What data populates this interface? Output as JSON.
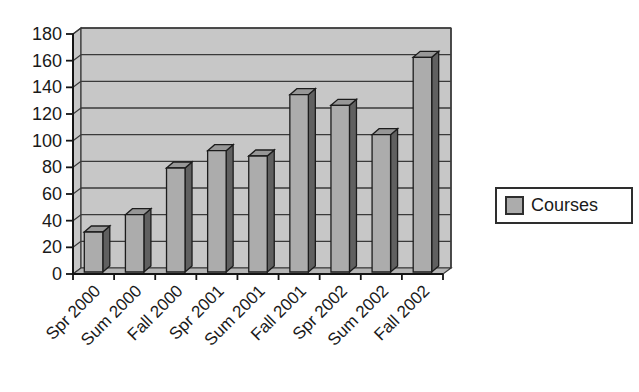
{
  "chart_data": {
    "type": "bar",
    "title": "",
    "xlabel": "",
    "ylabel": "",
    "categories": [
      "Spr 2000",
      "Sum 2000",
      "Fall 2000",
      "Spr 2001",
      "Sum 2001",
      "Fall 2001",
      "Spr 2002",
      "Sum 2002",
      "Fall 2002"
    ],
    "series": [
      {
        "name": "Courses",
        "values": [
          30,
          43,
          78,
          91,
          87,
          133,
          125,
          103,
          161
        ]
      }
    ],
    "ylim": [
      0,
      180
    ],
    "yticks": [
      0,
      20,
      40,
      60,
      80,
      100,
      120,
      140,
      160,
      180
    ],
    "grid": "horizontal",
    "effect": "3d",
    "legend": {
      "label": "Courses",
      "position": "right"
    },
    "colors": {
      "bar_front": "#acacac",
      "bar_side": "#606060",
      "bar_top": "#979797",
      "bar_stroke": "#1c1c1c",
      "wall": "#c7c7c7",
      "gridline": "#3a3a3a",
      "axis": "#151515",
      "text": "#1a1a1a",
      "background": "#ffffff"
    }
  }
}
